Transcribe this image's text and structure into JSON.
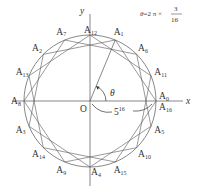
{
  "diagram": {
    "type": "star-polygon",
    "formula": {
      "lhs": "θ",
      "rhs_prefix": "=2 π ×",
      "fraction_numerator": "3",
      "fraction_denominator": "16"
    },
    "axes": {
      "x_label": "x",
      "y_label": "y",
      "origin_label": "O"
    },
    "angle_label": "θ",
    "radius_label": {
      "base": "5",
      "exponent": "16"
    },
    "step": 3,
    "n": 16,
    "vertices": [
      {
        "name": "A",
        "sub": "0",
        "k": 0
      },
      {
        "name": "A",
        "sub": "1",
        "k": 1
      },
      {
        "name": "A",
        "sub": "2",
        "k": 2
      },
      {
        "name": "A",
        "sub": "3",
        "k": 3
      },
      {
        "name": "A",
        "sub": "4",
        "k": 4
      },
      {
        "name": "A",
        "sub": "5",
        "k": 5
      },
      {
        "name": "A",
        "sub": "6",
        "k": 6
      },
      {
        "name": "A",
        "sub": "7",
        "k": 7
      },
      {
        "name": "A",
        "sub": "8",
        "k": 8
      },
      {
        "name": "A",
        "sub": "9",
        "k": 9
      },
      {
        "name": "A",
        "sub": "10",
        "k": 10
      },
      {
        "name": "A",
        "sub": "11",
        "k": 11
      },
      {
        "name": "A",
        "sub": "12",
        "k": 12
      },
      {
        "name": "A",
        "sub": "13",
        "k": 13
      },
      {
        "name": "A",
        "sub": "14",
        "k": 14
      },
      {
        "name": "A",
        "sub": "15",
        "k": 15
      },
      {
        "name": "A",
        "sub": "16",
        "k": 16
      }
    ],
    "colors": {
      "stroke": "#555555",
      "text": "#333333"
    }
  }
}
